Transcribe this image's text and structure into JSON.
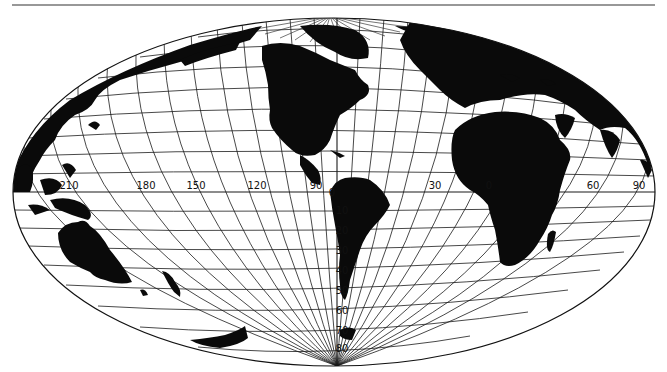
{
  "map": {
    "projection": "oblique elliptical world projection",
    "colors": {
      "land": "#0a0a0a",
      "water": "#ffffff",
      "grid": "#1a1a1a",
      "rule": "#333333"
    },
    "longitude_labels": [
      {
        "text": "210",
        "x": 69,
        "y": 189
      },
      {
        "text": "180",
        "x": 146,
        "y": 189
      },
      {
        "text": "150",
        "x": 196,
        "y": 189
      },
      {
        "text": "120",
        "x": 257,
        "y": 189
      },
      {
        "text": "90",
        "x": 316,
        "y": 189
      },
      {
        "text": "30",
        "x": 435,
        "y": 189
      },
      {
        "text": "0",
        "x": 489,
        "y": 189
      },
      {
        "text": "60",
        "x": 593,
        "y": 189
      },
      {
        "text": "90",
        "x": 639,
        "y": 189
      }
    ],
    "latitude_labels": [
      {
        "text": "0",
        "x": 332,
        "y": 196
      },
      {
        "text": "10",
        "x": 342,
        "y": 214
      },
      {
        "text": "20",
        "x": 342,
        "y": 234
      },
      {
        "text": "30",
        "x": 342,
        "y": 254
      },
      {
        "text": "40",
        "x": 342,
        "y": 274
      },
      {
        "text": "50",
        "x": 342,
        "y": 294
      },
      {
        "text": "60",
        "x": 342,
        "y": 314
      },
      {
        "text": "70",
        "x": 342,
        "y": 334
      },
      {
        "text": "80",
        "x": 342,
        "y": 352
      }
    ]
  }
}
